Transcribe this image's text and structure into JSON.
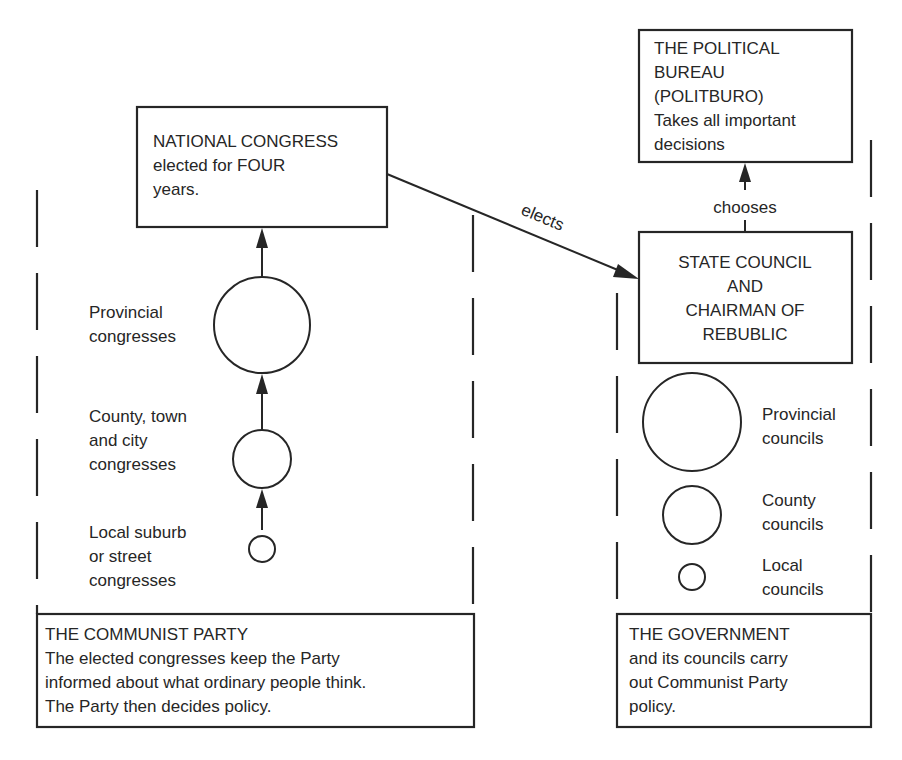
{
  "colors": {
    "ink": "#262626",
    "background": "#ffffff"
  },
  "party_panel": {
    "national_congress": {
      "lines": [
        "NATIONAL CONGRESS",
        "elected for FOUR",
        "years."
      ]
    },
    "levels": [
      {
        "label_lines": [
          "Provincial",
          "congresses"
        ],
        "size": "large"
      },
      {
        "label_lines": [
          "County, town",
          "and city",
          "congresses"
        ],
        "size": "medium"
      },
      {
        "label_lines": [
          "Local suburb",
          "or street",
          "congresses"
        ],
        "size": "small"
      }
    ],
    "caption_box": {
      "lines": [
        "THE COMMUNIST PARTY",
        "The elected congresses keep the Party",
        "informed about what ordinary people think.",
        "The Party then decides policy."
      ]
    }
  },
  "connector": {
    "label": "elects"
  },
  "government_panel": {
    "politburo": {
      "lines": [
        "THE POLITICAL",
        "BUREAU",
        "(POLITBURO)",
        "Takes all important",
        "decisions"
      ]
    },
    "chooses_label": "chooses",
    "state_council": {
      "lines": [
        "STATE COUNCIL",
        "AND",
        "CHAIRMAN OF",
        "REBUBLIC"
      ]
    },
    "levels": [
      {
        "label_lines": [
          "Provincial",
          "councils"
        ],
        "size": "large"
      },
      {
        "label_lines": [
          "County",
          "councils"
        ],
        "size": "medium"
      },
      {
        "label_lines": [
          "Local",
          "councils"
        ],
        "size": "small"
      }
    ],
    "caption_box": {
      "lines": [
        "THE GOVERNMENT",
        "and its councils carry",
        "out Communist Party",
        "policy."
      ]
    }
  }
}
